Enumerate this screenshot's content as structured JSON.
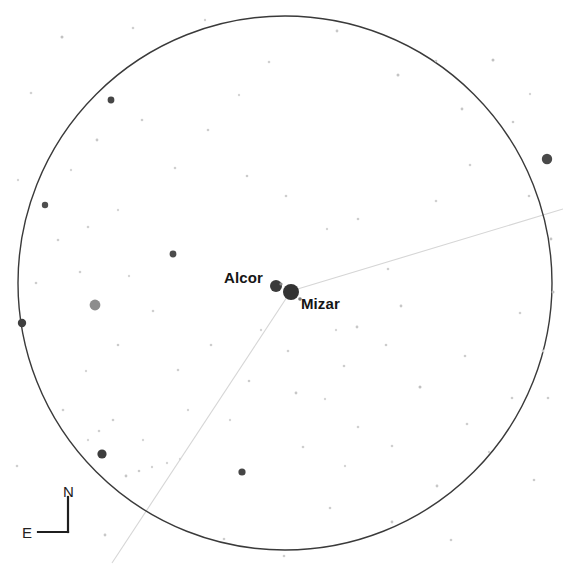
{
  "canvas": {
    "width": 563,
    "height": 570,
    "background": "#ffffff"
  },
  "chart_data": {
    "type": "scatter",
    "title": "",
    "subtitle": "",
    "xlabel": "",
    "ylabel": "",
    "grid": false,
    "legend": null,
    "field_of_view_circle": {
      "center_x": 285,
      "center_y": 283,
      "radius": 267,
      "stroke": "#3a3a3a",
      "stroke_width": 1.4,
      "fill": "none"
    },
    "constellation_lines": [
      {
        "name": "mizar-to-northeast",
        "x1": 291,
        "y1": 291,
        "x2": 563,
        "y2": 209,
        "stroke": "#d6d6d6",
        "stroke_width": 1.1
      },
      {
        "name": "mizar-to-southwest",
        "x1": 291,
        "y1": 291,
        "x2": 112,
        "y2": 563,
        "stroke": "#d6d6d6",
        "stroke_width": 1.1
      }
    ],
    "labeled_stars": [
      {
        "name": "Alcor",
        "x": 276,
        "y": 286,
        "radius": 6.0,
        "color": "#3b3b3b",
        "label": "Alcor",
        "label_x": 224,
        "label_y": 270,
        "label_anchor": "left"
      },
      {
        "name": "Mizar",
        "x": 291,
        "y": 292,
        "radius": 8.0,
        "color": "#333333",
        "label": "Mizar",
        "label_x": 301,
        "label_y": 296,
        "label_anchor": "left"
      }
    ],
    "field_stars": [
      {
        "x": 276,
        "y": 286,
        "r": 6.0,
        "c": "#3b3b3b"
      },
      {
        "x": 291,
        "y": 292,
        "r": 8.0,
        "c": "#333333"
      },
      {
        "x": 95,
        "y": 305,
        "r": 5.4,
        "c": "#8d8d8d"
      },
      {
        "x": 547,
        "y": 159,
        "r": 5.2,
        "c": "#494949"
      },
      {
        "x": 102,
        "y": 454,
        "r": 4.6,
        "c": "#3d3d3d"
      },
      {
        "x": 22,
        "y": 323,
        "r": 4.2,
        "c": "#3f3f3f"
      },
      {
        "x": 111,
        "y": 100,
        "r": 3.4,
        "c": "#464646"
      },
      {
        "x": 173,
        "y": 254,
        "r": 3.4,
        "c": "#4c4c4c"
      },
      {
        "x": 242,
        "y": 472,
        "r": 3.6,
        "c": "#464646"
      },
      {
        "x": 45,
        "y": 205,
        "r": 3.2,
        "c": "#4e4e4e"
      },
      {
        "x": 281,
        "y": 284,
        "r": 1.6,
        "c": "#8a8a8a"
      },
      {
        "x": 300,
        "y": 299,
        "r": 1.8,
        "c": "#7f7f7f"
      },
      {
        "x": 62,
        "y": 37,
        "r": 1.5,
        "c": "#c2c2c2"
      },
      {
        "x": 133,
        "y": 28,
        "r": 1.3,
        "c": "#cfcfcf"
      },
      {
        "x": 205,
        "y": 20,
        "r": 1.2,
        "c": "#d2d2d2"
      },
      {
        "x": 337,
        "y": 31,
        "r": 1.4,
        "c": "#c8c8c8"
      },
      {
        "x": 398,
        "y": 75,
        "r": 1.5,
        "c": "#c4c4c4"
      },
      {
        "x": 436,
        "y": 61,
        "r": 1.3,
        "c": "#cccccc"
      },
      {
        "x": 462,
        "y": 109,
        "r": 1.4,
        "c": "#c6c6c6"
      },
      {
        "x": 493,
        "y": 60,
        "r": 1.5,
        "c": "#c1c1c1"
      },
      {
        "x": 513,
        "y": 122,
        "r": 1.3,
        "c": "#cacaca"
      },
      {
        "x": 530,
        "y": 94,
        "r": 1.2,
        "c": "#d4d4d4"
      },
      {
        "x": 529,
        "y": 196,
        "r": 1.3,
        "c": "#cccccc"
      },
      {
        "x": 551,
        "y": 239,
        "r": 1.4,
        "c": "#c5c5c5"
      },
      {
        "x": 553,
        "y": 292,
        "r": 1.5,
        "c": "#bfbfbf"
      },
      {
        "x": 543,
        "y": 351,
        "r": 1.4,
        "c": "#c6c6c6"
      },
      {
        "x": 520,
        "y": 313,
        "r": 1.3,
        "c": "#cfcfcf"
      },
      {
        "x": 548,
        "y": 398,
        "r": 1.3,
        "c": "#cbcbcb"
      },
      {
        "x": 512,
        "y": 398,
        "r": 1.3,
        "c": "#cdcdcd"
      },
      {
        "x": 489,
        "y": 452,
        "r": 1.2,
        "c": "#d3d3d3"
      },
      {
        "x": 467,
        "y": 424,
        "r": 1.3,
        "c": "#cecece"
      },
      {
        "x": 437,
        "y": 486,
        "r": 1.4,
        "c": "#c8c8c8"
      },
      {
        "x": 465,
        "y": 356,
        "r": 1.3,
        "c": "#cdcdcd"
      },
      {
        "x": 420,
        "y": 387,
        "r": 1.5,
        "c": "#c0c0c0"
      },
      {
        "x": 401,
        "y": 306,
        "r": 1.4,
        "c": "#c7c7c7"
      },
      {
        "x": 386,
        "y": 345,
        "r": 1.3,
        "c": "#cccccc"
      },
      {
        "x": 392,
        "y": 446,
        "r": 1.3,
        "c": "#cfcfcf"
      },
      {
        "x": 392,
        "y": 522,
        "r": 1.4,
        "c": "#c9c9c9"
      },
      {
        "x": 330,
        "y": 508,
        "r": 1.3,
        "c": "#cdcdcd"
      },
      {
        "x": 345,
        "y": 466,
        "r": 1.2,
        "c": "#d4d4d4"
      },
      {
        "x": 303,
        "y": 447,
        "r": 1.3,
        "c": "#cecece"
      },
      {
        "x": 296,
        "y": 393,
        "r": 1.4,
        "c": "#c7c7c7"
      },
      {
        "x": 325,
        "y": 399,
        "r": 1.2,
        "c": "#d5d5d5"
      },
      {
        "x": 358,
        "y": 427,
        "r": 1.3,
        "c": "#d0d0d0"
      },
      {
        "x": 344,
        "y": 366,
        "r": 1.3,
        "c": "#cdcdcd"
      },
      {
        "x": 357,
        "y": 327,
        "r": 1.4,
        "c": "#c8c8c8"
      },
      {
        "x": 336,
        "y": 330,
        "r": 1.2,
        "c": "#d6d6d6"
      },
      {
        "x": 388,
        "y": 269,
        "r": 1.3,
        "c": "#cfcfcf"
      },
      {
        "x": 358,
        "y": 219,
        "r": 1.3,
        "c": "#cdcdcd"
      },
      {
        "x": 327,
        "y": 229,
        "r": 1.2,
        "c": "#d4d4d4"
      },
      {
        "x": 436,
        "y": 201,
        "r": 1.3,
        "c": "#d0d0d0"
      },
      {
        "x": 286,
        "y": 196,
        "r": 1.3,
        "c": "#cecece"
      },
      {
        "x": 247,
        "y": 176,
        "r": 1.3,
        "c": "#cbcbcb"
      },
      {
        "x": 208,
        "y": 130,
        "r": 1.3,
        "c": "#cdcdcd"
      },
      {
        "x": 239,
        "y": 95,
        "r": 1.2,
        "c": "#d4d4d4"
      },
      {
        "x": 175,
        "y": 168,
        "r": 1.3,
        "c": "#cfcfcf"
      },
      {
        "x": 142,
        "y": 120,
        "r": 1.3,
        "c": "#cdcdcd"
      },
      {
        "x": 97,
        "y": 140,
        "r": 1.4,
        "c": "#c7c7c7"
      },
      {
        "x": 71,
        "y": 170,
        "r": 1.2,
        "c": "#d6d6d6"
      },
      {
        "x": 58,
        "y": 240,
        "r": 1.3,
        "c": "#cecece"
      },
      {
        "x": 88,
        "y": 227,
        "r": 1.3,
        "c": "#d0d0d0"
      },
      {
        "x": 118,
        "y": 210,
        "r": 1.2,
        "c": "#d5d5d5"
      },
      {
        "x": 80,
        "y": 272,
        "r": 1.3,
        "c": "#cfcfcf"
      },
      {
        "x": 36,
        "y": 283,
        "r": 1.3,
        "c": "#cdcdcd"
      },
      {
        "x": 129,
        "y": 276,
        "r": 1.2,
        "c": "#d6d6d6"
      },
      {
        "x": 153,
        "y": 311,
        "r": 1.3,
        "c": "#cfcfcf"
      },
      {
        "x": 118,
        "y": 345,
        "r": 1.3,
        "c": "#cbcbcb"
      },
      {
        "x": 86,
        "y": 371,
        "r": 1.2,
        "c": "#d4d4d4"
      },
      {
        "x": 63,
        "y": 410,
        "r": 1.3,
        "c": "#cecece"
      },
      {
        "x": 113,
        "y": 420,
        "r": 1.3,
        "c": "#cdcdcd"
      },
      {
        "x": 143,
        "y": 440,
        "r": 1.2,
        "c": "#d5d5d5"
      },
      {
        "x": 126,
        "y": 476,
        "r": 1.4,
        "c": "#c6c6c6"
      },
      {
        "x": 139,
        "y": 471,
        "r": 1.3,
        "c": "#cbcbcb"
      },
      {
        "x": 152,
        "y": 467,
        "r": 1.2,
        "c": "#d2d2d2"
      },
      {
        "x": 167,
        "y": 463,
        "r": 1.2,
        "c": "#d4d4d4"
      },
      {
        "x": 180,
        "y": 459,
        "r": 1.2,
        "c": "#d6d6d6"
      },
      {
        "x": 99,
        "y": 431,
        "r": 1.3,
        "c": "#cfcfcf"
      },
      {
        "x": 88,
        "y": 440,
        "r": 1.2,
        "c": "#d5d5d5"
      },
      {
        "x": 178,
        "y": 370,
        "r": 1.3,
        "c": "#cfcfcf"
      },
      {
        "x": 211,
        "y": 345,
        "r": 1.3,
        "c": "#cdcdcd"
      },
      {
        "x": 249,
        "y": 381,
        "r": 1.3,
        "c": "#cccccc"
      },
      {
        "x": 230,
        "y": 420,
        "r": 1.2,
        "c": "#d6d6d6"
      },
      {
        "x": 188,
        "y": 410,
        "r": 1.2,
        "c": "#d4d4d4"
      },
      {
        "x": 261,
        "y": 330,
        "r": 1.2,
        "c": "#d6d6d6"
      },
      {
        "x": 288,
        "y": 351,
        "r": 1.3,
        "c": "#d0d0d0"
      },
      {
        "x": 105,
        "y": 535,
        "r": 1.4,
        "c": "#c8c8c8"
      },
      {
        "x": 224,
        "y": 539,
        "r": 1.3,
        "c": "#cdcdcd"
      },
      {
        "x": 284,
        "y": 556,
        "r": 1.3,
        "c": "#cecece"
      },
      {
        "x": 451,
        "y": 540,
        "r": 1.3,
        "c": "#cdcdcd"
      },
      {
        "x": 534,
        "y": 480,
        "r": 1.3,
        "c": "#cbcbcb"
      },
      {
        "x": 17,
        "y": 466,
        "r": 1.3,
        "c": "#cfcfcf"
      },
      {
        "x": 31,
        "y": 93,
        "r": 1.3,
        "c": "#d2d2d2"
      },
      {
        "x": 18,
        "y": 180,
        "r": 1.2,
        "c": "#d6d6d6"
      },
      {
        "x": 269,
        "y": 62,
        "r": 1.3,
        "c": "#d0d0d0"
      },
      {
        "x": 470,
        "y": 165,
        "r": 1.3,
        "c": "#cfcfcf"
      }
    ]
  },
  "labels": {
    "alcor": "Alcor",
    "mizar": "Mizar"
  },
  "compass": {
    "north_label": "N",
    "east_label": "E",
    "north_label_x": 63,
    "north_label_y": 484,
    "east_label_x": 22,
    "east_label_y": 525,
    "vertical_line": {
      "x1": 68,
      "y1": 497,
      "x2": 68,
      "y2": 532
    },
    "horizontal_line": {
      "x1": 68,
      "y1": 532,
      "x2": 38,
      "y2": 532
    },
    "stroke": "#1f1f1f",
    "stroke_width": 2.2
  }
}
